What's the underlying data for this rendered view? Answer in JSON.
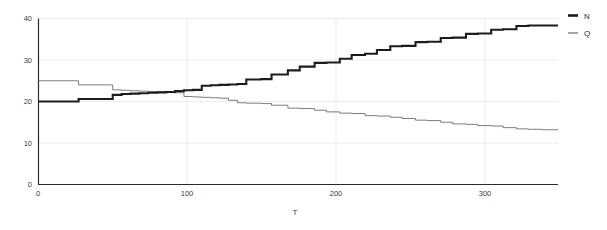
{
  "chart_data": {
    "type": "line",
    "title": "",
    "subtitle": "",
    "xlabel": "T",
    "ylabel": "",
    "xlim": [
      0,
      350
    ],
    "ylim": [
      0,
      40
    ],
    "xticks": [
      0,
      100,
      200,
      300
    ],
    "yticks": [
      0,
      10,
      20,
      30,
      40
    ],
    "xticklabels": [
      "0",
      "100",
      "200",
      "300"
    ],
    "yticklabels": [
      "0",
      "10",
      "20",
      "30",
      "40"
    ],
    "grid": true,
    "grid_axis": "both",
    "legend_position": "right",
    "drawstyle": "steps-post",
    "series": [
      {
        "name": "N",
        "label": "N",
        "color": "#1c1c1c",
        "linewidth": "thick",
        "x": [
          0,
          24,
          27,
          46,
          50,
          56,
          62,
          68,
          74,
          80,
          86,
          92,
          98,
          104,
          110,
          116,
          122,
          128,
          134,
          140,
          150,
          157,
          168,
          176,
          186,
          194,
          203,
          211,
          220,
          228,
          237,
          245,
          254,
          262,
          271,
          279,
          288,
          296,
          305,
          313,
          322,
          330,
          339,
          350
        ],
        "y": [
          20,
          20,
          20.6,
          20.6,
          21.6,
          21.8,
          21.9,
          22,
          22.1,
          22.2,
          22.3,
          22.5,
          22.7,
          22.8,
          23.8,
          23.9,
          24,
          24.1,
          24.2,
          25.3,
          25.4,
          26.5,
          27.5,
          28.4,
          29.3,
          29.4,
          30.3,
          31.2,
          31.5,
          32.4,
          33.3,
          33.4,
          34.3,
          34.4,
          35.3,
          35.4,
          36.3,
          36.4,
          37.3,
          37.4,
          38.2,
          38.3,
          38.3,
          38.3
        ]
      },
      {
        "name": "Q",
        "label": "Q",
        "color": "#6e6e6e",
        "linewidth": "thin",
        "x": [
          0,
          24,
          27,
          46,
          50,
          56,
          62,
          68,
          74,
          80,
          86,
          92,
          98,
          104,
          110,
          116,
          122,
          128,
          134,
          140,
          150,
          157,
          168,
          176,
          186,
          194,
          203,
          211,
          220,
          228,
          237,
          245,
          254,
          262,
          271,
          279,
          288,
          296,
          305,
          313,
          322,
          330,
          339,
          350
        ],
        "y": [
          25,
          25,
          24,
          24,
          22.8,
          22.7,
          22.6,
          22.5,
          22.4,
          22.3,
          22.2,
          22.1,
          21.2,
          21.1,
          21,
          20.9,
          20.8,
          20.3,
          19.7,
          19.6,
          19.5,
          19.1,
          18.4,
          18.3,
          17.9,
          17.5,
          17.2,
          17.1,
          16.6,
          16.5,
          16.2,
          15.9,
          15.5,
          15.4,
          15,
          14.6,
          14.5,
          14.2,
          14.1,
          13.7,
          13.4,
          13.3,
          13.2,
          13.2
        ]
      }
    ]
  },
  "legend": {
    "entries": [
      {
        "label": "N"
      },
      {
        "label": "Q"
      }
    ]
  },
  "axes": {
    "x_title": "T",
    "y_title": ""
  }
}
